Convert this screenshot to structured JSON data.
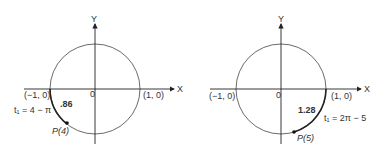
{
  "left": {
    "axis_x": "X",
    "axis_y": "Y",
    "origin": "0",
    "neg_point": "(−1, 0)",
    "pos_point": "(1, 0)",
    "t_label": "t₁ = 4 − π",
    "arc_value": ".86",
    "point_label": "P(4)"
  },
  "right": {
    "axis_x": "X",
    "axis_y": "Y",
    "origin": "0",
    "neg_point": "(−1, 0)",
    "pos_point": "(1, 0)",
    "t_label": "t₁ = 2π − 5",
    "arc_value": "1.28",
    "point_label": "P(5)"
  }
}
